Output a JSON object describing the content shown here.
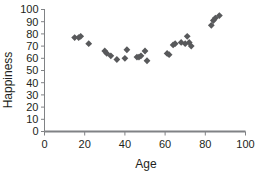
{
  "chart_data": {
    "type": "scatter",
    "title": "",
    "xlabel": "Age",
    "ylabel": "Happiness",
    "xlim": [
      0,
      100
    ],
    "ylim": [
      0,
      100
    ],
    "xticks": [
      0,
      20,
      40,
      60,
      80,
      100
    ],
    "yticks": [
      0,
      10,
      20,
      30,
      40,
      50,
      60,
      70,
      80,
      90,
      100
    ],
    "grid": false,
    "legend": null,
    "marker_shape": "diamond",
    "marker_color": "#58595b",
    "axis_color": "#808285",
    "text_color": "#231f20",
    "series": [
      {
        "name": "Happiness by Age",
        "points": [
          [
            15,
            77
          ],
          [
            17,
            77
          ],
          [
            18,
            78
          ],
          [
            22,
            72
          ],
          [
            30,
            66
          ],
          [
            31,
            64
          ],
          [
            33,
            62
          ],
          [
            36,
            59
          ],
          [
            40,
            60
          ],
          [
            41,
            67
          ],
          [
            46,
            61
          ],
          [
            47,
            61
          ],
          [
            48,
            62
          ],
          [
            50,
            66
          ],
          [
            51,
            58
          ],
          [
            61,
            64
          ],
          [
            62,
            63
          ],
          [
            64,
            71
          ],
          [
            65,
            72
          ],
          [
            68,
            73
          ],
          [
            70,
            72
          ],
          [
            71,
            78
          ],
          [
            72,
            73
          ],
          [
            73,
            70
          ],
          [
            83,
            87
          ],
          [
            84,
            91
          ],
          [
            85,
            93
          ],
          [
            87,
            95
          ]
        ]
      }
    ]
  },
  "axis_labels": {
    "x_title": "Age",
    "y_title": "Happiness"
  }
}
